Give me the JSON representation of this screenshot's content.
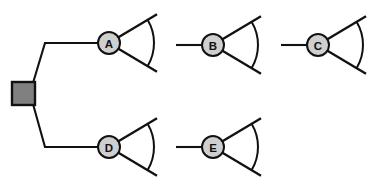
{
  "diagram": {
    "type": "node-fan-diagram",
    "canvas": {
      "width": 386,
      "height": 196,
      "background": "#ffffff"
    },
    "colors": {
      "stroke": "#111111",
      "node_fill": "#cfcfcf",
      "root_fill": "#808080",
      "background": "#ffffff"
    },
    "root": {
      "name": "root-square-node",
      "shape": "square",
      "x": 12,
      "y": 82,
      "width": 23,
      "height": 23,
      "fill": "#808080"
    },
    "nodes": [
      {
        "id": "A",
        "label": "A",
        "cx": 109,
        "cy": 43,
        "r": 11,
        "inbound": true,
        "fan": {
          "r_inner": 11,
          "r_outer": 56,
          "arc_r": 45,
          "angle_up": -31,
          "angle_down": 31
        }
      },
      {
        "id": "B",
        "label": "B",
        "cx": 213,
        "cy": 45,
        "r": 11,
        "inbound": true,
        "fan": {
          "r_inner": 11,
          "r_outer": 56,
          "arc_r": 45,
          "angle_up": -31,
          "angle_down": 31
        }
      },
      {
        "id": "C",
        "label": "C",
        "cx": 318,
        "cy": 45,
        "r": 11,
        "inbound": true,
        "fan": {
          "r_inner": 11,
          "r_outer": 56,
          "arc_r": 45,
          "angle_up": -31,
          "angle_down": 31
        }
      },
      {
        "id": "D",
        "label": "D",
        "cx": 109,
        "cy": 147,
        "r": 11,
        "inbound": true,
        "fan": {
          "r_inner": 11,
          "r_outer": 56,
          "arc_r": 45,
          "angle_up": -31,
          "angle_down": 31
        }
      },
      {
        "id": "E",
        "label": "E",
        "cx": 213,
        "cy": 147,
        "r": 11,
        "inbound": true,
        "fan": {
          "r_inner": 11,
          "r_outer": 56,
          "arc_r": 45,
          "angle_up": -31,
          "angle_down": 31
        }
      }
    ],
    "edges": [
      {
        "name": "edge-root-to-a",
        "from": "root",
        "to": "A",
        "path": "M 33 83 L 45 43 L 98 43"
      },
      {
        "name": "edge-root-to-d",
        "from": "root",
        "to": "D",
        "path": "M 33 104 L 45 147 L 98 147"
      },
      {
        "name": "edge-stub-b",
        "from": "none",
        "to": "B",
        "path": "M 176 45 L 202 45"
      },
      {
        "name": "edge-stub-c",
        "from": "none",
        "to": "C",
        "path": "M 281 45 L 307 45"
      },
      {
        "name": "edge-stub-e",
        "from": "none",
        "to": "E",
        "path": "M 176 147 L 202 147"
      }
    ]
  }
}
